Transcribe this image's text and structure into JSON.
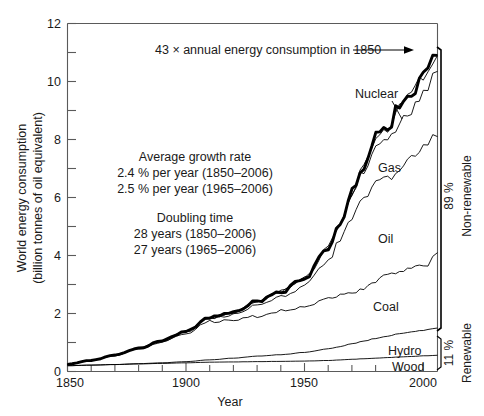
{
  "chart_data": {
    "type": "area",
    "title": "",
    "xlabel": "Year",
    "ylabel": "World energy consumption",
    "ylabel2": "(billion tonnes of oil equivalent)",
    "xlim": [
      1850,
      2006
    ],
    "ylim": [
      0,
      12
    ],
    "xticks_major": [
      1850,
      1900,
      1950,
      2000
    ],
    "xticks_major_labels": [
      "1850",
      "1900",
      "1950",
      "2000"
    ],
    "xtick_minor_step": 10,
    "yticks_major": [
      0,
      2,
      4,
      6,
      8,
      10,
      12
    ],
    "yticks_major_labels": [
      "0",
      "2",
      "4",
      "6",
      "8",
      "10",
      "12"
    ],
    "ytick_minor_step": 1,
    "grid": false,
    "legend_position": "inline-labels",
    "stacking": "cumulative",
    "x": [
      1850,
      1860,
      1870,
      1880,
      1890,
      1900,
      1910,
      1920,
      1930,
      1940,
      1950,
      1960,
      1965,
      1970,
      1975,
      1980,
      1985,
      1990,
      1995,
      2000,
      2006
    ],
    "series": [
      {
        "name": "Wood",
        "cumulative_values": [
          0.2,
          0.22,
          0.24,
          0.26,
          0.28,
          0.3,
          0.32,
          0.33,
          0.34,
          0.35,
          0.36,
          0.38,
          0.4,
          0.42,
          0.44,
          0.46,
          0.48,
          0.5,
          0.52,
          0.54,
          0.56
        ]
      },
      {
        "name": "Hydro",
        "cumulative_values": [
          0.2,
          0.22,
          0.24,
          0.27,
          0.3,
          0.34,
          0.4,
          0.46,
          0.53,
          0.58,
          0.66,
          0.78,
          0.86,
          0.96,
          1.05,
          1.14,
          1.22,
          1.3,
          1.36,
          1.42,
          1.5
        ]
      },
      {
        "name": "Coal",
        "cumulative_values": [
          0.25,
          0.38,
          0.55,
          0.78,
          1.02,
          1.3,
          1.72,
          1.78,
          1.9,
          2.1,
          2.2,
          2.48,
          2.62,
          2.7,
          2.85,
          3.15,
          3.35,
          3.5,
          3.55,
          3.6,
          4.1
        ]
      },
      {
        "name": "Oil",
        "cumulative_values": [
          0.25,
          0.38,
          0.56,
          0.8,
          1.06,
          1.36,
          1.82,
          1.96,
          2.3,
          2.58,
          2.95,
          3.85,
          4.5,
          5.35,
          5.95,
          6.55,
          6.6,
          7.0,
          7.35,
          7.75,
          8.1
        ]
      },
      {
        "name": "Gas",
        "cumulative_values": [
          0.25,
          0.38,
          0.56,
          0.8,
          1.07,
          1.38,
          1.86,
          2.02,
          2.42,
          2.75,
          3.22,
          4.3,
          5.1,
          6.15,
          6.95,
          7.8,
          7.95,
          8.55,
          9.0,
          9.6,
          10.35
        ]
      },
      {
        "name": "Nuclear",
        "cumulative_values": [
          0.25,
          0.38,
          0.56,
          0.8,
          1.07,
          1.38,
          1.86,
          2.02,
          2.42,
          2.75,
          3.22,
          4.3,
          5.12,
          6.2,
          7.1,
          8.05,
          8.4,
          9.15,
          9.65,
          10.25,
          10.9
        ]
      }
    ],
    "total_line": {
      "name": "Total world energy consumption",
      "values": [
        0.25,
        0.38,
        0.56,
        0.8,
        1.07,
        1.38,
        1.86,
        2.02,
        2.42,
        2.75,
        3.22,
        4.3,
        5.12,
        6.2,
        7.1,
        8.05,
        8.4,
        9.15,
        9.65,
        10.25,
        10.9
      ]
    },
    "annotations": {
      "peak": "43 ×  annual energy consumption in 1850",
      "stats_block_1": [
        "Average growth rate",
        "2.4 % per year (1850–2006)",
        "2.5 % per year (1965–2006)"
      ],
      "stats_block_2": [
        "Doubling time",
        "28 years (1850–2006)",
        "27 years (1965–2006)"
      ]
    },
    "brackets": [
      {
        "pct": "89 %",
        "label": "Non-renewable"
      },
      {
        "pct": "11 %",
        "label": "Renewable"
      }
    ]
  }
}
